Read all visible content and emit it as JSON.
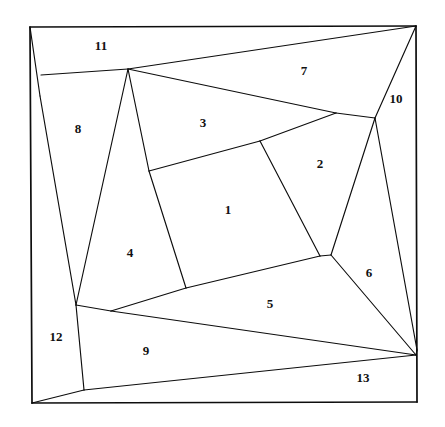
{
  "figure": {
    "background_color": "#ffffff",
    "line_color": "#0d0d0d",
    "label_color": "#111111",
    "width": 445,
    "height": 427
  },
  "frame": {
    "name": "outer-boundary",
    "points": "30,27 416,26 417,402 32,403"
  },
  "regions": [
    {
      "id": "region-1",
      "label": "1",
      "label_x": 228,
      "label_y": 211,
      "points": "149,171 260,141 320,256 186,288"
    },
    {
      "id": "region-2",
      "label": "2",
      "label_x": 320,
      "label_y": 165,
      "points": "260,141 336,113 375,118 331,255 320,256"
    },
    {
      "id": "region-3",
      "label": "3",
      "label_x": 203,
      "label_y": 124,
      "points": "128,69 336,113 260,141 149,171"
    },
    {
      "id": "region-4",
      "label": "4",
      "label_x": 130,
      "label_y": 254,
      "points": "128,69 149,171 186,288 111,311 76,305"
    },
    {
      "id": "region-5",
      "label": "5",
      "label_x": 270,
      "label_y": 305,
      "points": "111,311 186,288 320,256 331,255 416,355 355,352"
    },
    {
      "id": "region-6",
      "label": "6",
      "label_x": 369,
      "label_y": 274,
      "points": "375,118 417,350 416,355 331,255"
    },
    {
      "id": "region-7",
      "label": "7",
      "label_x": 304,
      "label_y": 72,
      "points": "128,69 416,26 375,118 336,113"
    },
    {
      "id": "region-8",
      "label": "8",
      "label_x": 78,
      "label_y": 130,
      "points": "41,75 128,69 76,305 40,96"
    },
    {
      "id": "region-9",
      "label": "9",
      "label_x": 146,
      "label_y": 352,
      "points": "76,305 111,311 416,355 84,390 32,403"
    },
    {
      "id": "region-10",
      "label": "10",
      "label_x": 396,
      "label_y": 100,
      "points": "416,26 417,350 375,118"
    },
    {
      "id": "region-11",
      "label": "11",
      "label_x": 101,
      "label_y": 47,
      "points": "30,27 416,26 128,69 41,75"
    },
    {
      "id": "region-12",
      "label": "12",
      "label_x": 56,
      "label_y": 338,
      "points": "30,27 40,96 76,305 84,390 32,403"
    },
    {
      "id": "region-13",
      "label": "13",
      "label_x": 363,
      "label_y": 379,
      "points": "84,390 416,355 417,402 32,403"
    }
  ],
  "edges": [
    {
      "name": "edge-outer-top",
      "points": "30,27 416,26",
      "frame": true
    },
    {
      "name": "edge-outer-right",
      "points": "416,26 417,402",
      "frame": true
    },
    {
      "name": "edge-outer-bottom",
      "points": "417,402 32,403",
      "frame": true
    },
    {
      "name": "edge-outer-left",
      "points": "32,403 30,27",
      "frame": true
    },
    {
      "name": "edge-11-8-3",
      "points": "41,75 128,69",
      "frame": false
    },
    {
      "name": "edge-11-7-diagonal",
      "points": "128,69 416,26",
      "frame": false
    },
    {
      "name": "edge-12-8-upper",
      "points": "30,27 40,96",
      "frame": false
    },
    {
      "name": "edge-12-8-lower",
      "points": "40,96 76,305",
      "frame": false
    },
    {
      "name": "edge-8-4",
      "points": "128,69 76,305",
      "frame": false
    },
    {
      "name": "edge-4-3-1",
      "points": "128,69 149,171",
      "frame": false
    },
    {
      "name": "edge-4-1",
      "points": "149,171 186,288",
      "frame": false
    },
    {
      "name": "edge-3-1-top",
      "points": "149,171 260,141",
      "frame": false
    },
    {
      "name": "edge-3-2-7",
      "points": "260,141 336,113",
      "frame": false
    },
    {
      "name": "edge-3-7-long",
      "points": "128,69 336,113",
      "frame": false
    },
    {
      "name": "edge-7-10-2-6",
      "points": "336,113 375,118",
      "frame": false
    },
    {
      "name": "edge-7-6-node",
      "points": "416,26 375,118",
      "frame": false
    },
    {
      "name": "edge-10-6",
      "points": "375,118 417,350",
      "frame": false
    },
    {
      "name": "edge-2-6",
      "points": "375,118 331,255",
      "frame": false
    },
    {
      "name": "edge-1-2",
      "points": "260,141 320,256",
      "frame": false
    },
    {
      "name": "edge-1-5",
      "points": "186,288 320,256",
      "frame": false
    },
    {
      "name": "edge-2-5-join",
      "points": "320,256 331,255",
      "frame": false
    },
    {
      "name": "edge-5-6-9",
      "points": "331,255 416,355",
      "frame": false
    },
    {
      "name": "edge-4-5-9",
      "points": "186,288 111,311",
      "frame": false
    },
    {
      "name": "edge-4-9-12",
      "points": "111,311 76,305",
      "frame": false
    },
    {
      "name": "edge-9-5-long",
      "points": "111,311 416,355",
      "frame": false
    },
    {
      "name": "edge-12-9-13",
      "points": "76,305 84,390",
      "frame": false
    },
    {
      "name": "edge-12-13",
      "points": "84,390 32,403",
      "frame": false
    },
    {
      "name": "edge-9-13-long",
      "points": "84,390 416,355",
      "frame": false
    },
    {
      "name": "edge-6-13-right",
      "points": "416,355 417,350",
      "frame": false
    }
  ]
}
